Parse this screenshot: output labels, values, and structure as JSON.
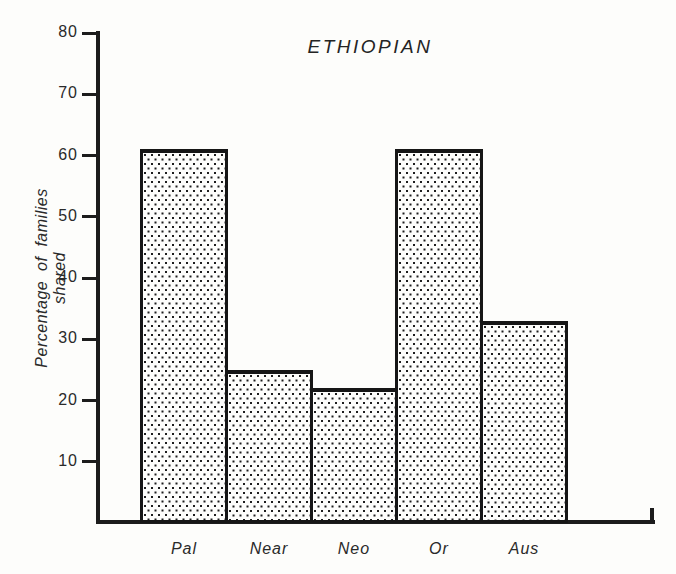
{
  "chart_data": {
    "type": "bar",
    "title": "ETHIOPIAN",
    "xlabel": "",
    "ylabel": "Percentage of families shared",
    "categories": [
      "Pal",
      "Near",
      "Neo",
      "Or",
      "Aus"
    ],
    "values": [
      61,
      25,
      22,
      61,
      33
    ],
    "ylim": [
      0,
      80
    ],
    "yticks": [
      10,
      20,
      30,
      40,
      50,
      60,
      70,
      80
    ],
    "grid": false,
    "legend": false,
    "bar_fill_style": "halftone-dots",
    "ink_color": "#1c1c1c",
    "paper_color": "#fdfdfb"
  }
}
